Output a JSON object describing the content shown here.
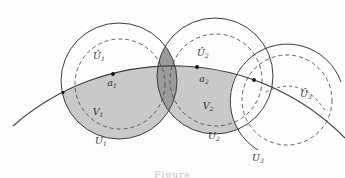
{
  "figure": {
    "caption_partial": "Figure",
    "colors": {
      "background": "#fdfdfd",
      "line": "#3c3c3c",
      "dashed_line": "#4f4f4f",
      "region_light": "#c9c9c9",
      "region_dark": "#9b9b9b",
      "dot": "#111111",
      "label": "#2e2e2e"
    },
    "labels": [
      {
        "name": "label-U1-hat",
        "main": "Û",
        "sub": "1",
        "x": 99,
        "y": 59
      },
      {
        "name": "label-U2-hat",
        "main": "Û",
        "sub": "2",
        "x": 203,
        "y": 56
      },
      {
        "name": "label-U3-hat",
        "main": "Û",
        "sub": "3",
        "x": 306,
        "y": 97
      },
      {
        "name": "label-a1",
        "main": "a",
        "sub": "1",
        "x": 112,
        "y": 86
      },
      {
        "name": "label-a2",
        "main": "a",
        "sub": "2",
        "x": 204,
        "y": 82
      },
      {
        "name": "label-V1",
        "main": "V",
        "sub": "1",
        "x": 98,
        "y": 115
      },
      {
        "name": "label-V2",
        "main": "V",
        "sub": "2",
        "x": 208,
        "y": 109
      },
      {
        "name": "label-U1",
        "main": "U",
        "sub": "1",
        "x": 101,
        "y": 144
      },
      {
        "name": "label-U2",
        "main": "U",
        "sub": "2",
        "x": 214,
        "y": 139
      },
      {
        "name": "label-U3",
        "main": "U",
        "sub": "3",
        "x": 258,
        "y": 161
      }
    ],
    "geometry": {
      "solid_circles": [
        {
          "name": "circle-U1",
          "cx": 119,
          "cy": 81,
          "r": 58
        },
        {
          "name": "circle-U2",
          "cx": 215,
          "cy": 76,
          "r": 58
        }
      ],
      "dashed_circles": [
        {
          "name": "dashed-circle-V1",
          "cx": 120,
          "cy": 84,
          "r": 45
        },
        {
          "name": "dashed-circle-V2",
          "cx": 216,
          "cy": 80,
          "r": 46
        },
        {
          "name": "dashed-circle-U3-hat",
          "cx": 287,
          "cy": 100,
          "r": 45
        }
      ],
      "arcs": [
        {
          "name": "arc-circle-U3",
          "d": "M 258 150 A 57 57 0 1 1 341 82",
          "style": "solid"
        },
        {
          "name": "curve-main",
          "d": "M 13 126 A 242 242 0 0 1 345 138",
          "style": "solid"
        },
        {
          "name": "dashed-arc-near-U3hat",
          "d": "M 266 92 Q 302 74 326 112",
          "style": "dashed"
        }
      ],
      "regions": {
        "below_curve_clip": "M 13 126 A 242 242 0 0 1 345 138 L 345 178 L 13 178 Z",
        "erase_circle": {
          "cx": 287,
          "cy": 100,
          "r": 57
        },
        "lens": "M 165.3 46.1 A 58 58 0 0 1 168.7 110.9 A 58 58 0 0 1 165.3 46.1 Z"
      },
      "dots": [
        {
          "name": "dot-curve-entry",
          "x": 63,
          "y": 92.5,
          "r": 1.5
        },
        {
          "name": "dot-a1",
          "x": 113,
          "y": 74,
          "r": 1.9
        },
        {
          "name": "dot-a2",
          "x": 197,
          "y": 67,
          "r": 1.9
        },
        {
          "name": "dot-junction",
          "x": 254,
          "y": 80,
          "r": 1.9
        }
      ]
    }
  }
}
